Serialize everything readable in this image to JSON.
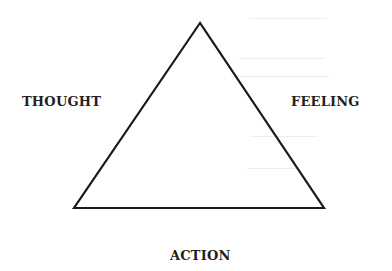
{
  "diagram": {
    "type": "triangle",
    "nodes": {
      "left": "THOUGHT",
      "right": "FEELING",
      "bottom": "ACTION"
    },
    "triangle": {
      "apex": [
        200,
        23
      ],
      "bottom_left": [
        74,
        208
      ],
      "bottom_right": [
        324,
        208
      ],
      "stroke_color": "#1a1a1a",
      "stroke_width": 2.2
    },
    "background_color": "#ffffff"
  }
}
